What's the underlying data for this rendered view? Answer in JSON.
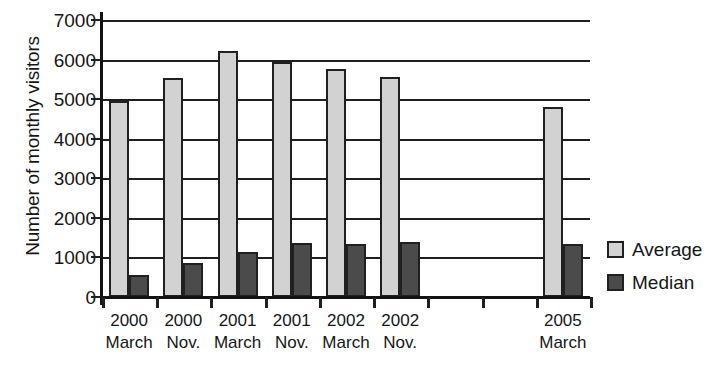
{
  "chart_data": {
    "type": "bar",
    "title": "",
    "xlabel": "",
    "ylabel": "Number of monthly visitors",
    "ylim": [
      0,
      7000
    ],
    "ytick_step": 1000,
    "yticks": [
      7000,
      6000,
      5000,
      4000,
      3000,
      2000,
      1000,
      0
    ],
    "grid": true,
    "legend_position": "right",
    "categories": [
      "2000 March",
      "2000 Nov.",
      "2001 March",
      "2001 Nov.",
      "2002 March",
      "2002 Nov.",
      "",
      "",
      "2005 March"
    ],
    "category_lines": [
      {
        "line1": "2000",
        "line2": "March"
      },
      {
        "line1": "2000",
        "line2": "Nov."
      },
      {
        "line1": "2001",
        "line2": "March"
      },
      {
        "line1": "2001",
        "line2": "Nov."
      },
      {
        "line1": "2002",
        "line2": "March"
      },
      {
        "line1": "2002",
        "line2": "Nov."
      },
      {
        "line1": "",
        "line2": ""
      },
      {
        "line1": "",
        "line2": ""
      },
      {
        "line1": "2005",
        "line2": "March"
      }
    ],
    "series": [
      {
        "name": "Average",
        "color": "#d2d2d2",
        "values": [
          4960,
          5540,
          6210,
          5940,
          5770,
          5550,
          null,
          null,
          4800
        ]
      },
      {
        "name": "Median",
        "color": "#4b4b4b",
        "values": [
          550,
          870,
          1140,
          1370,
          1330,
          1390,
          null,
          null,
          1330
        ]
      }
    ]
  },
  "legend": {
    "items": [
      {
        "label": "Average",
        "swatch": "light-gray-swatch"
      },
      {
        "label": "Median",
        "swatch": "dark-gray-swatch"
      }
    ]
  },
  "axes": {
    "y_title": "Number of monthly visitors"
  },
  "colors": {
    "average_fill": "#d2d2d2",
    "median_fill": "#4b4b4b",
    "outline": "#202020",
    "gridline": "#1f1f1f",
    "text": "#161616",
    "background": "#ffffff"
  }
}
